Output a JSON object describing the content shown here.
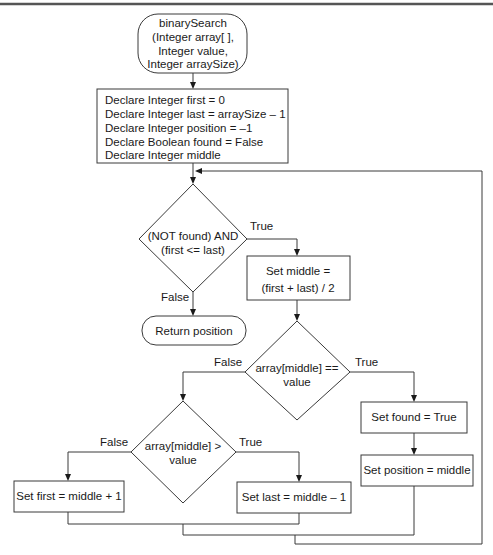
{
  "diagram": {
    "type": "flowchart",
    "title": "binarySearch",
    "start": {
      "lines": [
        "binarySearch",
        "(Integer array[ ],",
        "Integer value,",
        "Integer arraySize)"
      ]
    },
    "declarations": {
      "lines": [
        "Declare Integer first = 0",
        "Declare Integer last = arraySize – 1",
        "Declare Integer position = –1",
        "Declare Boolean found = False",
        "Declare Integer middle"
      ]
    },
    "loop_condition": {
      "lines": [
        "(NOT found) AND",
        "(first <= last)"
      ],
      "true_label": "True",
      "false_label": "False"
    },
    "set_middle": {
      "lines": [
        "Set middle =",
        "(first + last) / 2"
      ]
    },
    "return": {
      "label": "Return position"
    },
    "equal_check": {
      "lines": [
        "array[middle] ==",
        "value"
      ],
      "true_label": "True",
      "false_label": "False"
    },
    "greater_check": {
      "lines": [
        "array[middle] >",
        "value"
      ],
      "true_label": "True",
      "false_label": "False"
    },
    "set_found": {
      "label": "Set found = True"
    },
    "set_position": {
      "label": "Set position = middle"
    },
    "set_first": {
      "label": "Set first = middle + 1"
    },
    "set_last": {
      "label": "Set last = middle – 1"
    }
  }
}
